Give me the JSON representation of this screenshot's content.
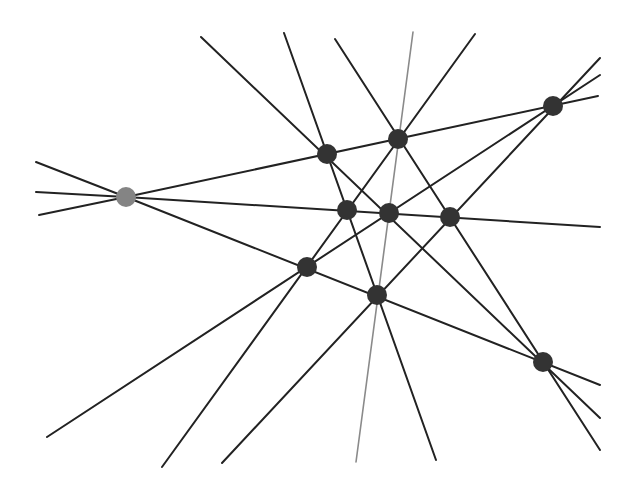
{
  "diagram": {
    "type": "line-arrangement",
    "colors": {
      "line": "#222222",
      "special_line": "#8a8a8a",
      "node": "#333333",
      "special_node": "#848484",
      "background": "#ffffff"
    },
    "nodes": [
      {
        "id": "G",
        "x": 126,
        "y": 197,
        "special": true
      },
      {
        "id": "A",
        "x": 327,
        "y": 154
      },
      {
        "id": "B",
        "x": 398,
        "y": 139
      },
      {
        "id": "C",
        "x": 553,
        "y": 106
      },
      {
        "id": "D",
        "x": 347,
        "y": 210
      },
      {
        "id": "E",
        "x": 389,
        "y": 213
      },
      {
        "id": "F",
        "x": 450,
        "y": 217
      },
      {
        "id": "H",
        "x": 307,
        "y": 267
      },
      {
        "id": "I",
        "x": 377,
        "y": 295
      },
      {
        "id": "J",
        "x": 543,
        "y": 362
      }
    ],
    "lines": [
      {
        "id": "L1",
        "x1": 126,
        "y1": 197,
        "x2": 598,
        "y2": 96,
        "through": [
          "G",
          "A",
          "B",
          "C"
        ]
      },
      {
        "id": "L2",
        "x1": 126,
        "y1": 197,
        "x2": 600,
        "y2": 227,
        "through": [
          "G",
          "D",
          "E",
          "F"
        ]
      },
      {
        "id": "L3",
        "x1": 126,
        "y1": 197,
        "x2": 600,
        "y2": 385,
        "through": [
          "G",
          "H",
          "I",
          "J"
        ]
      },
      {
        "id": "L4",
        "x1": 36,
        "y1": 162,
        "x2": 126,
        "y2": 197,
        "through": [
          "G"
        ]
      },
      {
        "id": "L5",
        "x1": 36,
        "y1": 192,
        "x2": 126,
        "y2": 197,
        "through": [
          "G"
        ]
      },
      {
        "id": "L6",
        "x1": 39,
        "y1": 215,
        "x2": 126,
        "y2": 197,
        "through": [
          "G"
        ]
      },
      {
        "id": "L7",
        "x1": 201,
        "y1": 37,
        "x2": 600,
        "y2": 418,
        "through": [
          "A",
          "E",
          "J"
        ]
      },
      {
        "id": "L8",
        "x1": 284,
        "y1": 33,
        "x2": 436,
        "y2": 460,
        "through": [
          "A",
          "D",
          "I"
        ]
      },
      {
        "id": "L9",
        "x1": 335,
        "y1": 39,
        "x2": 600,
        "y2": 450,
        "through": [
          "B",
          "F",
          "J"
        ]
      },
      {
        "id": "L10",
        "x1": 413,
        "y1": 32,
        "x2": 356,
        "y2": 462,
        "through": [
          "E",
          "I"
        ],
        "special": true
      },
      {
        "id": "L11",
        "x1": 475,
        "y1": 34,
        "x2": 162,
        "y2": 467,
        "through": [
          "B",
          "D",
          "H"
        ]
      },
      {
        "id": "L12",
        "x1": 600,
        "y1": 75,
        "x2": 47,
        "y2": 437,
        "through": [
          "C",
          "E",
          "H"
        ]
      },
      {
        "id": "L13",
        "x1": 600,
        "y1": 58,
        "x2": 222,
        "y2": 463,
        "through": [
          "C",
          "F",
          "I"
        ]
      }
    ]
  }
}
